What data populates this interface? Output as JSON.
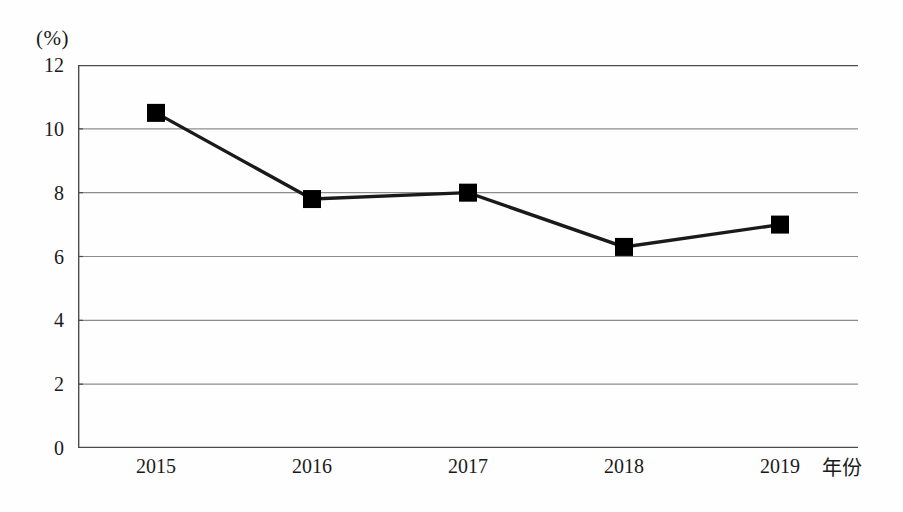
{
  "chart_data": {
    "type": "line",
    "title": "",
    "subtitle": "",
    "xlabel": "年份",
    "ylabel": "(%)",
    "categories": [
      "2015",
      "2016",
      "2017",
      "2018",
      "2019"
    ],
    "values": [
      10.5,
      7.8,
      8.0,
      6.3,
      7.0
    ],
    "series": [
      {
        "name": "",
        "values": [
          10.5,
          7.8,
          8.0,
          6.3,
          7.0
        ]
      }
    ],
    "ylim": [
      0,
      12
    ],
    "y_ticks": [
      "0",
      "2",
      "4",
      "6",
      "8",
      "10",
      "12"
    ],
    "y_tick_values": [
      0,
      2,
      4,
      6,
      8,
      10,
      12
    ],
    "x_ticks": [
      "2015",
      "2016",
      "2017",
      "2018",
      "2019"
    ],
    "grid": true,
    "grid_axis": "y",
    "legend": false,
    "legend_position": "none",
    "marker": "square",
    "marker_color": "#000000",
    "line_color": "#1a1a1a",
    "grid_color": "#8c8c8c",
    "axis_color": "#4d4d4d",
    "background_color": "#fefefe",
    "annotations": []
  },
  "axes": {
    "y_unit": "(%)",
    "x_caption": "年份"
  }
}
